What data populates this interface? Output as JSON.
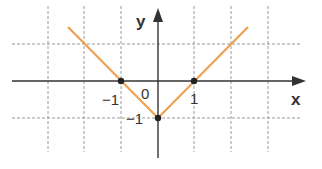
{
  "graph": {
    "function": "y = |x| - 1",
    "x_axis_label": "x",
    "y_axis_label": "y",
    "origin_label": "0",
    "tick_labels": {
      "x_neg1": "−1",
      "x_pos1": "1",
      "y_neg1": "−1"
    },
    "points": [
      {
        "x": -1,
        "y": 0
      },
      {
        "x": 1,
        "y": 0
      },
      {
        "x": 0,
        "y": -1
      }
    ],
    "colors": {
      "line": "#f0a050",
      "grid": "#9a9a9a",
      "axis": "#333333",
      "point": "#222222"
    }
  }
}
